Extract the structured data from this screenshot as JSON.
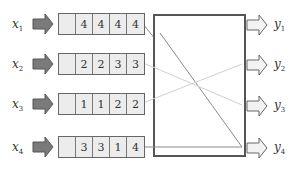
{
  "diagram": {
    "inputs": [
      {
        "label": "x",
        "sub": "1",
        "values": [
          "",
          "4",
          "4",
          "4",
          "4"
        ]
      },
      {
        "label": "x",
        "sub": "2",
        "values": [
          "",
          "2",
          "2",
          "3",
          "3"
        ]
      },
      {
        "label": "x",
        "sub": "3",
        "values": [
          "",
          "1",
          "1",
          "2",
          "2"
        ]
      },
      {
        "label": "x",
        "sub": "4",
        "values": [
          "",
          "3",
          "3",
          "1",
          "4"
        ]
      }
    ],
    "outputs": [
      {
        "label": "y",
        "sub": "1"
      },
      {
        "label": "y",
        "sub": "2"
      },
      {
        "label": "y",
        "sub": "3"
      },
      {
        "label": "y",
        "sub": "4"
      }
    ],
    "connections": [
      {
        "from": "x1",
        "to": "y4"
      },
      {
        "from": "x2",
        "to": "y3"
      },
      {
        "from": "x3",
        "to": "y2"
      },
      {
        "from": "x4",
        "to": "y4"
      }
    ],
    "colors": {
      "input_arrow": "#7a7a7a",
      "output_arrow": "#f2f2f2",
      "cell_fill": "#ececec",
      "line_dark": "#888888",
      "line_light": "#cfcfcf"
    }
  }
}
